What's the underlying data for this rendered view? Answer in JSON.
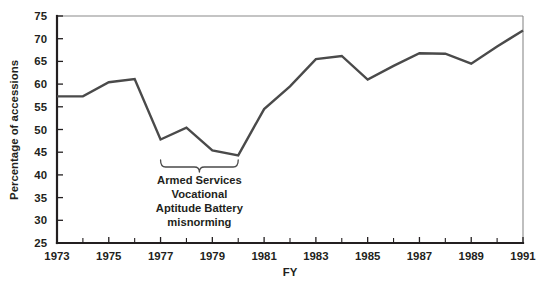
{
  "chart_data": {
    "type": "line",
    "title": "",
    "xlabel": "FY",
    "ylabel": "Percentage of accessions",
    "xlim": [
      1973,
      1991
    ],
    "ylim": [
      25,
      75
    ],
    "grid": false,
    "legend": "none",
    "x": [
      1973,
      1974,
      1975,
      1976,
      1977,
      1978,
      1979,
      1980,
      1981,
      1982,
      1983,
      1984,
      1985,
      1986,
      1987,
      1988,
      1989,
      1990,
      1991
    ],
    "values": [
      57.3,
      57.3,
      60.4,
      61.1,
      47.8,
      50.4,
      45.4,
      44.3,
      54.5,
      59.5,
      65.5,
      66.2,
      61.0,
      64.0,
      66.8,
      66.7,
      64.5,
      68.3,
      71.8
    ],
    "series": [
      {
        "name": "Percentage of accessions",
        "values": [
          57.3,
          57.3,
          60.4,
          61.1,
          47.8,
          50.4,
          45.4,
          44.3,
          54.5,
          59.5,
          65.5,
          66.2,
          61.0,
          64.0,
          66.8,
          66.7,
          64.5,
          68.3,
          71.8
        ]
      }
    ],
    "y_ticks": [
      25,
      30,
      35,
      40,
      45,
      50,
      55,
      60,
      65,
      70,
      75
    ],
    "y_tick_labels": [
      "25",
      "30",
      "35",
      "40",
      "45",
      "50",
      "55",
      "60",
      "65",
      "70",
      "75"
    ],
    "x_ticks_major": [
      1973,
      1975,
      1977,
      1979,
      1981,
      1983,
      1985,
      1987,
      1989,
      1991
    ],
    "x_tick_labels": [
      "1973",
      "1975",
      "1977",
      "1979",
      "1981",
      "1983",
      "1985",
      "1987",
      "1989",
      "1991"
    ],
    "x_ticks_minor": [
      1974,
      1976,
      1978,
      1980,
      1982,
      1984,
      1986,
      1988,
      1990
    ],
    "annotations": [
      {
        "name": "asvab-misnorming-brace",
        "lines": [
          "Armed Services",
          "Vocational",
          "Aptitude Battery",
          "misnorming"
        ],
        "text": "Armed Services Vocational Aptitude Battery misnorming",
        "span_start": 1977,
        "span_end": 1980
      }
    ],
    "colors": {
      "line": "#4a4a4a",
      "axis": "#231f20",
      "text": "#231f20",
      "background": "#ffffff",
      "frame": "#8a8a8a"
    }
  }
}
